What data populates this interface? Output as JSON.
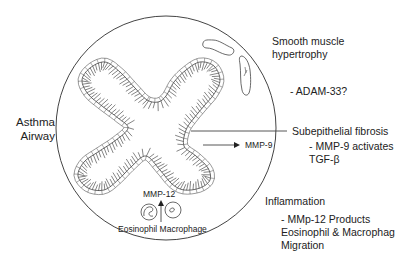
{
  "diagram": {
    "title_lines": [
      "Asthma",
      "Airway"
    ],
    "inner_labels": {
      "mmp9": "MMP-9",
      "mmp12": "MMP-12",
      "cells": "Eosinophil Macrophage"
    },
    "annotations": {
      "smooth_muscle": [
        "Smooth muscle",
        "hypertrophy"
      ],
      "adam33": "- ADAM-33?",
      "fibrosis": "Subepithelial fibrosis",
      "fibrosis_detail": [
        "- MMP-9 activates",
        "TGF-β"
      ],
      "inflammation": "Inflammation",
      "inflammation_detail": [
        "- MMp-12 Products",
        "Eosinophil & Macrophag",
        "Migration"
      ]
    },
    "colors": {
      "line": "#333333",
      "background": "#ffffff"
    }
  }
}
